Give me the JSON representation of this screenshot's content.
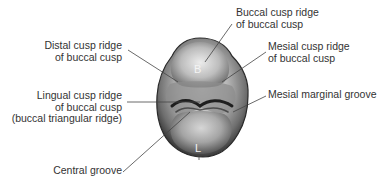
{
  "figure": {
    "colors": {
      "text": "#333333",
      "leader_line": "#444444",
      "tooth_dark": "#2a2a2a",
      "tooth_mid": "#8a8a8a",
      "tooth_light": "#d8d8d8"
    },
    "surface_letters": {
      "buccal": "B",
      "lingual": "L"
    },
    "labels": {
      "buccal_cusp_ridge": {
        "line1": "Buccal cusp ridge",
        "line2": "of buccal cusp"
      },
      "distal_cusp_ridge": {
        "line1": "Distal cusp ridge",
        "line2": "of buccal cusp"
      },
      "mesial_cusp_ridge": {
        "line1": "Mesial cusp ridge",
        "line2": "of buccal cusp"
      },
      "lingual_cusp_ridge": {
        "line1": "Lingual cusp ridge",
        "line2": "of buccal cusp",
        "line3": "(buccal triangular ridge)"
      },
      "mesial_marginal_groove": {
        "line1": "Mesial marginal groove"
      },
      "central_groove": {
        "line1": "Central groove"
      }
    }
  }
}
